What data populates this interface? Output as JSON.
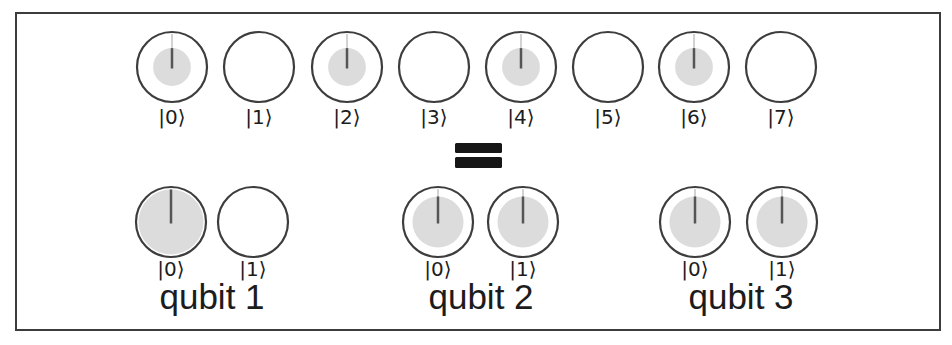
{
  "figure": {
    "equals_label": "=",
    "colors": {
      "background": "#ffffff",
      "frame_stroke": "#3c3c3c",
      "circle_stroke": "#3d3d3d",
      "amplitude_fill": "#dcdcdc",
      "phase_line": "#555555",
      "phase_line_faint": "#d2d2d2",
      "equals": "#161616",
      "text": "#1c1c1c"
    },
    "register_row": {
      "states": [
        {
          "label": "|0⟩",
          "filled": true,
          "fill_ratio": 0.54
        },
        {
          "label": "|1⟩",
          "filled": false,
          "fill_ratio": 0
        },
        {
          "label": "|2⟩",
          "filled": true,
          "fill_ratio": 0.54
        },
        {
          "label": "|3⟩",
          "filled": false,
          "fill_ratio": 0
        },
        {
          "label": "|4⟩",
          "filled": true,
          "fill_ratio": 0.54
        },
        {
          "label": "|5⟩",
          "filled": false,
          "fill_ratio": 0
        },
        {
          "label": "|6⟩",
          "filled": true,
          "fill_ratio": 0.54
        },
        {
          "label": "|7⟩",
          "filled": false,
          "fill_ratio": 0
        }
      ]
    },
    "qubit_rows": [
      {
        "name": "qubit 1",
        "states": [
          {
            "label": "|0⟩",
            "filled": true,
            "fill_ratio": 0.93
          },
          {
            "label": "|1⟩",
            "filled": false,
            "fill_ratio": 0
          }
        ]
      },
      {
        "name": "qubit 2",
        "states": [
          {
            "label": "|0⟩",
            "filled": true,
            "fill_ratio": 0.73
          },
          {
            "label": "|1⟩",
            "filled": true,
            "fill_ratio": 0.73
          }
        ]
      },
      {
        "name": "qubit 3",
        "states": [
          {
            "label": "|0⟩",
            "filled": true,
            "fill_ratio": 0.73
          },
          {
            "label": "|1⟩",
            "filled": true,
            "fill_ratio": 0.73
          }
        ]
      }
    ]
  }
}
